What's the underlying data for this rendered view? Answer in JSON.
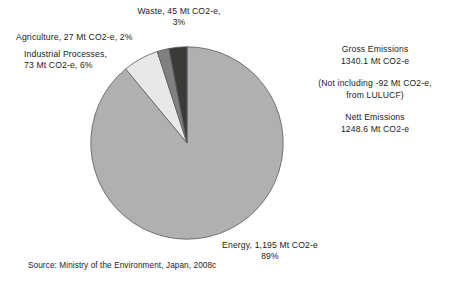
{
  "chart_data": {
    "type": "pie",
    "title": "",
    "unit": "Mt CO2-e",
    "categories": [
      "Energy",
      "Industrial Processes",
      "Agriculture",
      "Waste"
    ],
    "values": [
      1195,
      73,
      27,
      45
    ],
    "percentages": [
      89,
      6,
      2,
      3
    ],
    "colors": [
      "#b0b0b0",
      "#e8e8e8",
      "#808080",
      "#3a3a38"
    ],
    "start_angle_deg": 0,
    "direction": "clockwise",
    "legend": "none",
    "grid": false,
    "slices": [
      {
        "name": "Energy",
        "value": 1195,
        "percent": 89,
        "color": "#b0b0b0"
      },
      {
        "name": "Industrial Processes",
        "value": 73,
        "percent": 6,
        "color": "#e8e8e8"
      },
      {
        "name": "Agriculture",
        "value": 27,
        "percent": 2,
        "color": "#808080"
      },
      {
        "name": "Waste",
        "value": 45,
        "percent": 3,
        "color": "#3a3a38"
      }
    ],
    "annotations": [
      "Gross Emissions 1340.1 Mt CO2-e",
      "(Not including -92 Mt CO2-e, from LULUCF)",
      "Nett Emissions 1248.6 Mt CO2-e"
    ]
  },
  "labels": {
    "waste": {
      "line1": "Waste, 45 Mt CO2-e,",
      "line2": "3%"
    },
    "agriculture": {
      "line1": "Agriculture, 27 Mt CO2-e,  2%"
    },
    "industrial": {
      "line1": "Industrial Processes,",
      "line2": "73 Mt CO2-e,  6%"
    },
    "energy": {
      "line1": "Energy, 1,195 Mt CO2-e",
      "line2": "89%"
    }
  },
  "side_notes": {
    "gross": {
      "line1": "Gross Emissions",
      "line2": "1340.1 Mt CO2-e"
    },
    "lulucf": {
      "line1": "(Not including -92 Mt CO2-e,",
      "line2": "from LULUCF)"
    },
    "nett": {
      "line1": "Nett Emissions",
      "line2": "1248.6 Mt CO2-e"
    }
  },
  "source": "Source: Ministry of the Environment, Japan, 2008c"
}
